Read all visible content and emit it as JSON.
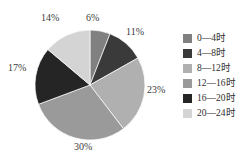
{
  "chart_data": {
    "type": "pie",
    "title": "",
    "subtitle": "",
    "xlabel": "",
    "ylabel": "",
    "grid": false,
    "legend_position": "right",
    "start_angle_deg": 0,
    "direction": "clockwise",
    "categories": [
      "0—4时",
      "4—8时",
      "8—12时",
      "12—16时",
      "16—20时",
      "20—24时"
    ],
    "values": [
      6,
      11,
      23,
      30,
      17,
      14
    ],
    "value_unit": "%",
    "data_labels": [
      "6%",
      "11%",
      "23%",
      "30%",
      "17%",
      "14%"
    ],
    "colors": [
      "#808080",
      "#3a3a3a",
      "#b0b0b0",
      "#9a9a9a",
      "#252525",
      "#d4d4d4"
    ],
    "slices": [
      {
        "label": "0—4时",
        "value": 6,
        "display": "6%",
        "color": "#808080"
      },
      {
        "label": "4—8时",
        "value": 11,
        "display": "11%",
        "color": "#3a3a3a"
      },
      {
        "label": "8—12时",
        "value": 23,
        "display": "23%",
        "color": "#b0b0b0"
      },
      {
        "label": "12—16时",
        "value": 30,
        "display": "30%",
        "color": "#9a9a9a"
      },
      {
        "label": "16—20时",
        "value": 17,
        "display": "17%",
        "color": "#252525"
      },
      {
        "label": "20—24时",
        "value": 14,
        "display": "14%",
        "color": "#d4d4d4"
      }
    ]
  },
  "pie": {
    "center_x": 90,
    "center_y": 85,
    "radius": 55,
    "labels": [
      {
        "text": "6%",
        "x": 86,
        "y": 12
      },
      {
        "text": "11%",
        "x": 126,
        "y": 26
      },
      {
        "text": "23%",
        "x": 147,
        "y": 84
      },
      {
        "text": "30%",
        "x": 74,
        "y": 141
      },
      {
        "text": "17%",
        "x": 8,
        "y": 62
      },
      {
        "text": "14%",
        "x": 41,
        "y": 12
      }
    ]
  },
  "legend": {
    "items": [
      {
        "label": "0—4时",
        "color": "#808080"
      },
      {
        "label": "4—8时",
        "color": "#3a3a3a"
      },
      {
        "label": "8—12时",
        "color": "#b0b0b0"
      },
      {
        "label": "12—16时",
        "color": "#9a9a9a"
      },
      {
        "label": "16—20时",
        "color": "#252525"
      },
      {
        "label": "20—24时",
        "color": "#d4d4d4"
      }
    ]
  },
  "canvas": {
    "background": "#ffffff"
  }
}
